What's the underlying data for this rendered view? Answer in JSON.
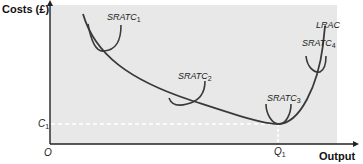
{
  "diagram": {
    "type": "cost-curves",
    "y_axis_label": "Costs (£)",
    "x_axis_label": "Output",
    "origin_label": "O",
    "c_label": {
      "main": "C",
      "sub": "1"
    },
    "q_label": {
      "main": "Q",
      "sub": "1"
    },
    "curves": [
      {
        "name": "SRATC",
        "sub": "1"
      },
      {
        "name": "SRATC",
        "sub": "2"
      },
      {
        "name": "SRATC",
        "sub": "3"
      },
      {
        "name": "SRATC",
        "sub": "4"
      },
      {
        "name": "LRAC",
        "sub": ""
      }
    ],
    "colors": {
      "plot_background": "#e8e8e8",
      "curve": "#3a3a3a",
      "axis": "#222222",
      "guide": "#ffffff"
    }
  }
}
